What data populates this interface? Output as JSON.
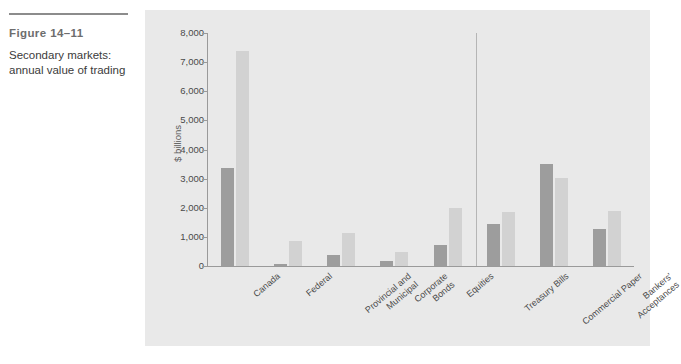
{
  "caption": {
    "figure_number": "Figure 14–11",
    "caption_line1": "Secondary markets:",
    "caption_line2": "annual value of trading"
  },
  "legend": {
    "position": "top-right",
    "items": [
      {
        "label": "2000",
        "color": "#9d9d9d"
      },
      {
        "label": "2012",
        "color": "#d2d2d2"
      }
    ]
  },
  "sections": [
    {
      "name": "Capital",
      "label": "Capital"
    },
    {
      "name": "Money",
      "label": "Money"
    }
  ],
  "chart_data": {
    "type": "bar",
    "title": "",
    "subtitle": "",
    "xlabel": "",
    "ylabel": "$ billions",
    "ylim": [
      0,
      8000
    ],
    "yticks": [
      0,
      1000,
      2000,
      3000,
      4000,
      5000,
      6000,
      7000,
      8000
    ],
    "ytick_labels": [
      "0",
      "1,000",
      "2,000",
      "3,000",
      "4,000",
      "5,000",
      "6,000",
      "7,000",
      "8,000"
    ],
    "grid": false,
    "legend_position": "top-right",
    "categories": [
      "Canada",
      "Federal",
      "Provincial and Municipal",
      "Corporate Bonds",
      "Equities",
      "Treasury Bills",
      "Commercial Paper",
      "Bankers' Acceptances"
    ],
    "category_labels": [
      [
        "Canada"
      ],
      [
        "Federal"
      ],
      [
        "Provincial and",
        "Municipal"
      ],
      [
        "Corporate",
        "Bonds"
      ],
      [
        "Equities"
      ],
      [
        "Treasury Bills"
      ],
      [
        "Commercial Paper"
      ],
      [
        "Bankers'",
        "Acceptances"
      ]
    ],
    "series": [
      {
        "name": "2000",
        "color": "#9d9d9d",
        "values": [
          3350,
          60,
          370,
          170,
          730,
          1450,
          3500,
          1280
        ]
      },
      {
        "name": "2012",
        "color": "#d2d2d2",
        "values": [
          7380,
          870,
          1150,
          480,
          1980,
          1870,
          3020,
          1880
        ]
      }
    ],
    "group_spans": [
      {
        "label": "Capital",
        "categories": [
          "Canada",
          "Federal",
          "Provincial and Municipal",
          "Corporate Bonds",
          "Equities"
        ]
      },
      {
        "label": "Money",
        "categories": [
          "Treasury Bills",
          "Commercial Paper",
          "Bankers' Acceptances"
        ]
      }
    ],
    "annotations": [
      {
        "text": "Capital",
        "type": "section-label"
      },
      {
        "text": "Money",
        "type": "section-label"
      }
    ]
  },
  "colors": {
    "panel_background": "#e9e9e9",
    "axis": "#9a9a9a",
    "divider": "#b5b5b5",
    "text": "#4a4a4a"
  }
}
